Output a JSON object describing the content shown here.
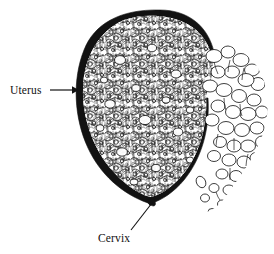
{
  "figure": {
    "background_color": "#ffffff",
    "ink_color": "#111111",
    "width": 274,
    "height": 254
  },
  "labels": [
    {
      "id": "uterus",
      "text": "Uterus",
      "text_x": 10,
      "text_y": 94,
      "leader": {
        "type": "arrow-horizontal",
        "x1": 50,
        "y1": 90,
        "x2": 76,
        "y2": 90
      }
    },
    {
      "id": "cervix",
      "text": "Cervix",
      "text_x": 98,
      "text_y": 242,
      "leader": {
        "type": "arrow-diagonal",
        "x1": 130,
        "y1": 231,
        "x2": 155,
        "y2": 199
      }
    }
  ],
  "structures": {
    "uterine_wall": {
      "name": "uterine wall",
      "style": "thick black outline"
    },
    "molar_tissue_interior": {
      "name": "vesicular molar tissue",
      "style": "dense bubbly texture"
    },
    "extruded_vesicle_cluster": {
      "name": "extruded grape-like vesicles",
      "style": "open outlined bubbles"
    }
  },
  "icons": {
    "arrow_head": "arrow-head-icon"
  }
}
